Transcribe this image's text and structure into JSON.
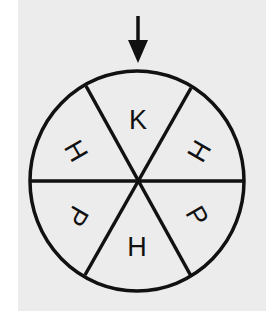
{
  "diagram": {
    "type": "spinner",
    "colors": {
      "background": "#ececec",
      "margin": "#ffffff",
      "stroke": "#111111"
    },
    "pointer": {
      "direction": "down",
      "points_to_sector": 0
    },
    "sectors": [
      {
        "position": "top",
        "label": "K"
      },
      {
        "position": "upper-right",
        "label": "H"
      },
      {
        "position": "lower-right",
        "label": "P"
      },
      {
        "position": "bottom",
        "label": "H"
      },
      {
        "position": "lower-left",
        "label": "P"
      },
      {
        "position": "upper-left",
        "label": "H"
      }
    ]
  }
}
